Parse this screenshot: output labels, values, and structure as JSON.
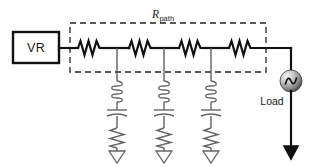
{
  "diagram": {
    "type": "schematic",
    "background_color": "#ffffff",
    "canvas": {
      "width": 315,
      "height": 167
    },
    "labels": {
      "source_box": "VR",
      "path_resistance_symbol": "R",
      "path_resistance_subscript": "path",
      "load": "Load"
    },
    "colors": {
      "wire": "#111111",
      "shunt": "#666666",
      "dashed_box": "#222222",
      "text": "#1a1a1a",
      "ac_source_light": "#e8e8e8",
      "ac_source_dark": "#555555"
    },
    "components": {
      "voltage_regulator": {
        "name": "VR",
        "label": "VR",
        "shape": "rectangle",
        "x": 13,
        "y": 32,
        "width": 46,
        "height": 31
      },
      "path_resistors": [
        {
          "id": "R1",
          "cx": 89,
          "cy": 48
        },
        {
          "id": "R2",
          "cx": 140,
          "cy": 48
        },
        {
          "id": "R3",
          "cx": 190,
          "cy": 48
        },
        {
          "id": "R4",
          "cx": 240,
          "cy": 48
        }
      ],
      "shunt_branches": [
        {
          "id": "branch-1",
          "x": 117,
          "tap_y": 48,
          "inductor_y": 92,
          "capacitor_y": 113,
          "resistor_y": 135,
          "ground_y": 155
        },
        {
          "id": "branch-2",
          "x": 164,
          "tap_y": 48,
          "inductor_y": 92,
          "capacitor_y": 113,
          "resistor_y": 135,
          "ground_y": 155
        },
        {
          "id": "branch-3",
          "x": 211,
          "tap_y": 48,
          "inductor_y": 92,
          "capacitor_y": 113,
          "resistor_y": 135,
          "ground_y": 155
        }
      ],
      "branch_element_order": [
        "inductor",
        "capacitor",
        "resistor",
        "ground"
      ],
      "ac_load_source": {
        "label": "Load",
        "symbol": "ac-sine-source",
        "cx": 291,
        "cy": 81,
        "r": 11
      },
      "dashed_boundary": {
        "label": "R_path",
        "x": 70,
        "y": 23,
        "width": 196,
        "height": 49
      },
      "grounds": [
        {
          "id": "gnd-1",
          "style": "open-triangle",
          "x": 117,
          "y": 150
        },
        {
          "id": "gnd-2",
          "style": "open-triangle",
          "x": 164,
          "y": 150
        },
        {
          "id": "gnd-3",
          "style": "open-triangle",
          "x": 211,
          "y": 150
        },
        {
          "id": "gnd-load",
          "style": "solid-triangle",
          "x": 291,
          "y": 146
        }
      ]
    }
  }
}
